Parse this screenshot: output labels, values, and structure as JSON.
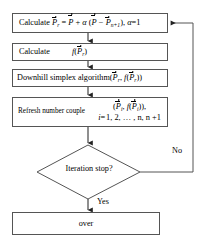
{
  "diagram": {
    "background_color": "#ffffff",
    "line_color": "#555555",
    "text_color": "#000000"
  },
  "nodes": {
    "calculate_pr": {
      "type": "process",
      "label": "Calculate",
      "formula_plain": "P_r = P-bar + α (P-bar − P_{n+1}), α = 1",
      "var_pr": "P",
      "sub_r": "r",
      "equals": "=",
      "var_pbar": "P",
      "plus": "+",
      "alpha": "α",
      "open_paren": "(",
      "minus": "−",
      "var_pn1": "P",
      "sub_n1": "n+1",
      "close_paren": ")",
      "comma": ",",
      "alpha2": "α",
      "equals2": "=",
      "alpha_value": "1"
    },
    "calculate_fpr": {
      "type": "process",
      "label": "Calculate",
      "formula_plain": "f(P-bar_r)",
      "func": "f",
      "open_paren": "(",
      "var_p": "P",
      "sub_r": "r",
      "close_paren": ")"
    },
    "downhill": {
      "type": "process",
      "label": "Downhill simplex algorithm",
      "formula_plain": "(P-bar_r, f(P-bar_r))",
      "open_paren": "(",
      "var_p1": "P",
      "sub_r1": "r",
      "comma": ",",
      "func": "f",
      "open_paren2": "(",
      "var_p2": "P",
      "sub_r2": "r",
      "close_paren2": ")",
      "close_paren": ")"
    },
    "refresh": {
      "type": "process",
      "label": "Refresh number couple",
      "formula_line1_plain": "(P-bar_i, f(P-bar_i)),",
      "formula_line2_plain": "i = 1, 2, ... , n, n+1",
      "open_paren": "(",
      "var_p1": "P",
      "sub_i1": "i",
      "comma1": ",",
      "func": "f",
      "open_paren2": "(",
      "var_p2": "P",
      "sub_i2": "i",
      "close_paren2": ")",
      "close_paren": ")",
      "comma2": ",",
      "index_var": "i",
      "index_equals": "=",
      "index_values": "1, 2, … , n, n +1"
    },
    "decision": {
      "type": "decision",
      "label": "Iteration stop?"
    },
    "over": {
      "type": "terminal",
      "label": "over"
    }
  },
  "edge_labels": {
    "no": "No",
    "yes": "Yes"
  }
}
